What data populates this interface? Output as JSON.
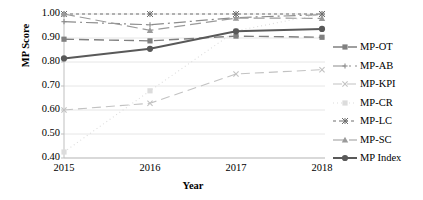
{
  "chart_data": {
    "type": "line",
    "title": "",
    "xlabel": "Year",
    "ylabel": "MP Score",
    "categories": [
      "2015",
      "2016",
      "2017",
      "2018"
    ],
    "x": [
      2015,
      2016,
      2017,
      2018
    ],
    "xlim": [
      2015,
      2018
    ],
    "ylim": [
      0.4,
      1.0
    ],
    "yticks": [
      "0.40",
      "0.50",
      "0.60",
      "0.70",
      "0.80",
      "0.90",
      "1.00"
    ],
    "ytick_values": [
      0.4,
      0.5,
      0.6,
      0.7,
      0.8,
      0.9,
      1.0
    ],
    "grid": "horizontal",
    "legend_position": "right",
    "series": [
      {
        "name": "MP-OT",
        "values": [
          0.895,
          0.888,
          0.908,
          0.903
        ],
        "marker": "square",
        "dash": "10 5",
        "color": "#808080",
        "width": 1.4
      },
      {
        "name": "MP-AB",
        "values": [
          0.968,
          0.955,
          0.985,
          0.997
        ],
        "marker": "plus",
        "dash": "12 4 2 4",
        "color": "#8c8c8c",
        "width": 1.2
      },
      {
        "name": "MP-KPI",
        "values": [
          0.6,
          0.628,
          0.75,
          0.768
        ],
        "marker": "cross",
        "dash": "9 5",
        "color": "#c2c2c2",
        "width": 1.1
      },
      {
        "name": "MP-CR",
        "values": [
          0.425,
          0.68,
          0.93,
          1.0
        ],
        "marker": "square",
        "dash": "1 3",
        "color": "#dcdcdc",
        "width": 1.1
      },
      {
        "name": "MP-LC",
        "values": [
          1.0,
          1.0,
          1.0,
          1.0
        ],
        "marker": "asterisk",
        "dash": "3 3",
        "color": "#6e6e6e",
        "width": 1.2
      },
      {
        "name": "MP-SC",
        "values": [
          1.0,
          0.932,
          0.983,
          0.982
        ],
        "marker": "triangle",
        "dash": "11 5",
        "color": "#9a9a9a",
        "width": 1.2
      },
      {
        "name": "MP Index",
        "values": [
          0.815,
          0.855,
          0.928,
          0.938
        ],
        "marker": "circle",
        "dash": "none",
        "color": "#595959",
        "width": 2.0
      }
    ]
  },
  "axes": {
    "y_title": "MP Score",
    "x_title": "Year"
  },
  "legend": {
    "items": [
      {
        "label": "MP-OT"
      },
      {
        "label": "MP-AB"
      },
      {
        "label": "MP-KPI"
      },
      {
        "label": "MP-CR"
      },
      {
        "label": "MP-LC"
      },
      {
        "label": "MP-SC"
      },
      {
        "label": "MP Index"
      }
    ]
  },
  "colors": {
    "grid": "#e6e6e6",
    "axis": "#bfbfbf",
    "text": "#000000",
    "background": "#ffffff"
  }
}
